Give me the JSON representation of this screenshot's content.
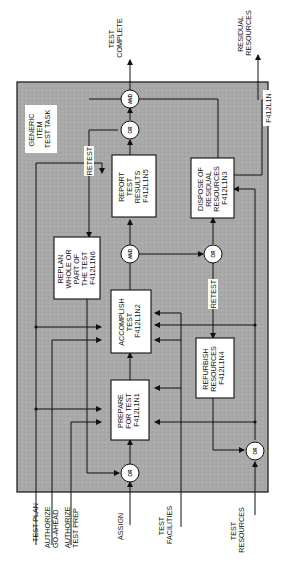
{
  "diagram": {
    "title": "GENERIC ITEM TEST TASK",
    "title_lines": [
      "GENERIC",
      "ITEM",
      "TEST TASK"
    ],
    "frame_id": "F412L1N",
    "colors": {
      "frame_fill": "#a9a9a9",
      "box_fill": "#ffffff",
      "line": "#111111"
    },
    "boxes": [
      {
        "id": "F412L1N1",
        "lines": [
          "PREPARE",
          "FOR TEST",
          "F412L1N1"
        ]
      },
      {
        "id": "F412L1N2",
        "lines": [
          "ACCOMPLISH",
          "TEST",
          "F412L1N2"
        ]
      },
      {
        "id": "F412L1N6",
        "lines": [
          "REPLAN",
          "WHOLE OR",
          "PART OF",
          "THE TEST",
          "F412L1N6"
        ]
      },
      {
        "id": "F412L1N5",
        "lines": [
          "REPORT",
          "TEST",
          "RESULTS",
          "F412L1N5"
        ]
      },
      {
        "id": "F412L1N4",
        "lines": [
          "REFURBISH",
          "RESOURCES",
          "F412L1N4"
        ]
      },
      {
        "id": "F412L1N3",
        "lines": [
          "DISPOSE OF",
          "RESIDUAL",
          "RESOURCES",
          "F412L1N3"
        ]
      }
    ],
    "gates": {
      "or_assign": "OR",
      "or_resources": "OR",
      "and_accomplish": "AND",
      "or_refurbish": "OR",
      "or_report": "OR",
      "and_complete": "AND"
    },
    "edge_labels": {
      "retest_top": "RETEST",
      "retest_right": "RETEST"
    },
    "inputs": {
      "test_plan": [
        "TEST PLAN"
      ],
      "authorize_go_ahead": [
        "AUTHORIZE",
        "GO-AHEAD"
      ],
      "authorize_test_prep": [
        "AUTHORIZE",
        "TEST PREP"
      ],
      "assign": [
        "ASSIGN"
      ],
      "test_facilities": [
        "TEST",
        "FACILITIES"
      ],
      "test_resources": [
        "TEST",
        "RESOURCES"
      ]
    },
    "outputs": {
      "test_complete": [
        "TEST",
        "COMPLETE"
      ],
      "residual_resources": [
        "RESIDUAL",
        "RESOURCES"
      ]
    }
  }
}
